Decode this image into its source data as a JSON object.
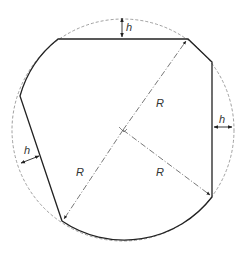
{
  "diagram": {
    "colors": {
      "outline": "#222222",
      "dashed_circle": "#888888",
      "radius_lines": "#555555",
      "label": "#333333"
    },
    "labels": {
      "h_top": "h",
      "h_right": "h",
      "h_left": "h",
      "R_upper": "R",
      "R_lower_left": "R",
      "R_lower_right": "R"
    }
  }
}
